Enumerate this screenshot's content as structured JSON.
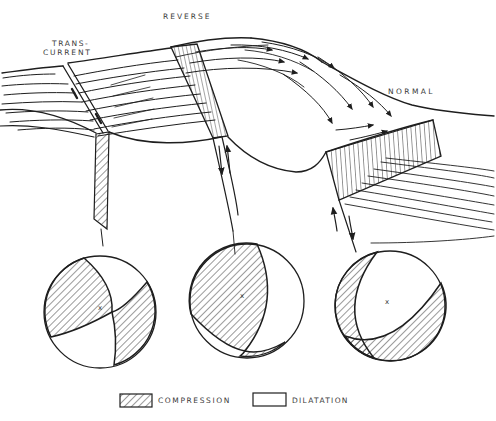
{
  "figure": {
    "background": "#ffffff",
    "ink_color": "#1e1e1e",
    "label_color": "#3a3a3a"
  },
  "fault_labels": {
    "transcurrent_line1": "TRANS-",
    "transcurrent_line2": "CURRENT",
    "reverse": "REVERSE",
    "normal": "NORMAL"
  },
  "focal_mechanisms": {
    "transcurrent_marker": "x",
    "reverse_marker": "x",
    "normal_marker": "x",
    "hatch_meaning": "compression",
    "white_meaning": "dilatation"
  },
  "legend": {
    "compression_label": "COMPRESSION",
    "dilatation_label": "DILATATION",
    "compression_swatch": "diagonal-hatch",
    "dilatation_swatch": "plain-white"
  }
}
